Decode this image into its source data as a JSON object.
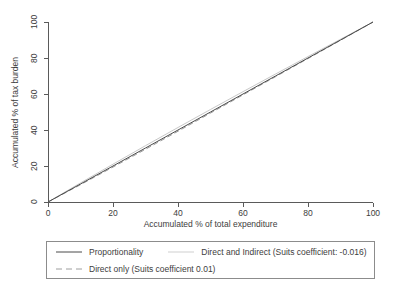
{
  "chart_data": {
    "type": "line",
    "title": "",
    "subtitle": "",
    "xlabel": "Accumulated % of total expenditure",
    "ylabel": "Accumulated % of tax burden",
    "xlim": [
      0,
      100
    ],
    "ylim": [
      0,
      100
    ],
    "xticks": [
      "0",
      "20",
      "40",
      "60",
      "80",
      "100"
    ],
    "yticks": [
      "0",
      "20",
      "40",
      "60",
      "80",
      "100"
    ],
    "xtick_values": [
      0,
      20,
      40,
      60,
      80,
      100
    ],
    "ytick_values": [
      0,
      20,
      40,
      60,
      80,
      100
    ],
    "grid": false,
    "legend_position": "below-axes",
    "x": [
      0,
      10,
      20,
      30,
      40,
      50,
      60,
      70,
      80,
      90,
      100
    ],
    "series": [
      {
        "name": "Proportionality",
        "style": "solid",
        "color": "#4a4a4a",
        "values": [
          0,
          10,
          20,
          30,
          40,
          50,
          60,
          70,
          80,
          90,
          100
        ]
      },
      {
        "name": "Direct and Indirect (Suits coefficient: -0.016)",
        "style": "solid",
        "color": "#c8c8c8",
        "suits_coefficient": -0.016,
        "values": [
          0,
          10.6,
          21.0,
          31.3,
          41.4,
          51.4,
          61.3,
          71.1,
          80.8,
          90.4,
          100
        ]
      },
      {
        "name": "Direct only (Suits coefficient 0.01)",
        "style": "dashed",
        "color": "#9a9a9a",
        "suits_coefficient": 0.01,
        "values": [
          0,
          9.6,
          19.4,
          29.3,
          39.3,
          49.4,
          59.5,
          69.6,
          79.7,
          89.8,
          100
        ]
      }
    ]
  },
  "axes": {
    "y_title": "Accumulated % of tax burden",
    "x_title": "Accumulated % of total expenditure",
    "y_ticks": [
      {
        "label": "0",
        "value": 0
      },
      {
        "label": "20",
        "value": 20
      },
      {
        "label": "40",
        "value": 40
      },
      {
        "label": "60",
        "value": 60
      },
      {
        "label": "80",
        "value": 80
      },
      {
        "label": "100",
        "value": 100
      }
    ],
    "x_ticks": [
      {
        "label": "0",
        "value": 0
      },
      {
        "label": "20",
        "value": 20
      },
      {
        "label": "40",
        "value": 40
      },
      {
        "label": "60",
        "value": 60
      },
      {
        "label": "80",
        "value": 80
      },
      {
        "label": "100",
        "value": 100
      }
    ]
  },
  "legend": {
    "entries": [
      {
        "label": "Proportionality",
        "style": "solid",
        "color": "#4a4a4a"
      },
      {
        "label": "Direct and Indirect (Suits coefficient: -0.016)",
        "style": "solid",
        "color": "#c8c8c8"
      },
      {
        "label": "Direct only (Suits coefficient 0.01)",
        "style": "dashed",
        "color": "#9a9a9a"
      }
    ]
  }
}
